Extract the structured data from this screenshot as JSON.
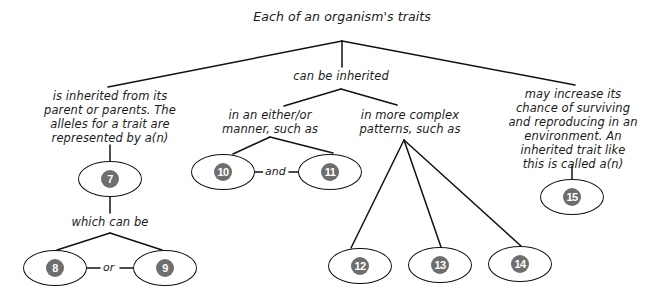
{
  "diagram": {
    "title": "Each of an organism's traits",
    "branches": {
      "left": {
        "text_lines": [
          "is inherited from its",
          "parent or parents. The",
          "alleles for a trait are",
          "represented by a(n)"
        ],
        "sub_label": "which can be",
        "connector": "or"
      },
      "middle": {
        "text": "can be inherited",
        "either_or": {
          "text_lines": [
            "in an either/or",
            "manner, such as"
          ],
          "connector": "and"
        },
        "complex": {
          "text_lines": [
            "in more complex",
            "patterns, such as"
          ]
        }
      },
      "right": {
        "text_lines": [
          "may increase its",
          "chance of surviving",
          "and reproducing in an",
          "environment. An",
          "inherited trait like",
          "this is called a(n)"
        ]
      }
    },
    "nodes": [
      {
        "id": "7",
        "label": "7"
      },
      {
        "id": "8",
        "label": "8"
      },
      {
        "id": "9",
        "label": "9"
      },
      {
        "id": "10",
        "label": "10"
      },
      {
        "id": "11",
        "label": "11"
      },
      {
        "id": "12",
        "label": "12"
      },
      {
        "id": "13",
        "label": "13"
      },
      {
        "id": "14",
        "label": "14"
      },
      {
        "id": "15",
        "label": "15"
      }
    ],
    "colors": {
      "line": "#111111",
      "badge": "#6e6e6e",
      "text": "#1a1a1a"
    }
  }
}
